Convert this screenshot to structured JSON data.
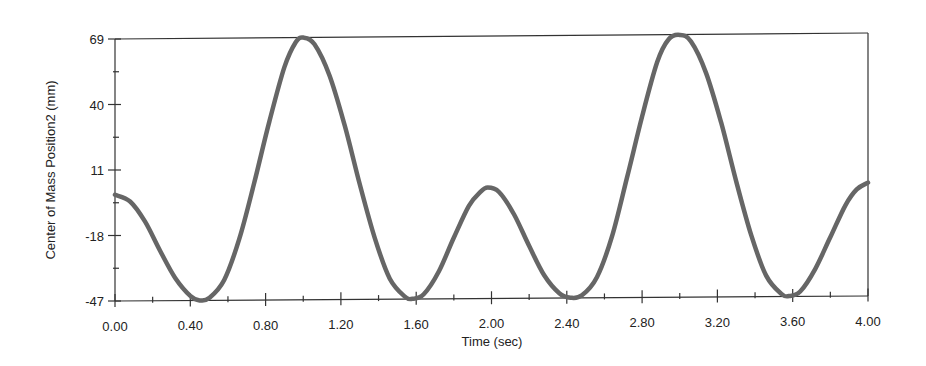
{
  "chart_data": {
    "type": "line",
    "title": "",
    "xlabel": "Time (sec)",
    "ylabel": "Center of Mass Position2 (mm)",
    "xlim": [
      0.0,
      4.0
    ],
    "ylim": [
      -47,
      69
    ],
    "grid": false,
    "legend": null,
    "x_ticks": [
      "0.00",
      "0.40",
      "0.80",
      "1.20",
      "1.60",
      "2.00",
      "2.40",
      "2.80",
      "3.20",
      "3.60",
      "4.00"
    ],
    "y_ticks": [
      "69",
      "40",
      "11",
      "-18",
      "-47"
    ],
    "series": [
      {
        "name": "Center of Mass Position2",
        "color": "#666666",
        "x": [
          0.0,
          0.08,
          0.16,
          0.24,
          0.32,
          0.4,
          0.45,
          0.5,
          0.58,
          0.66,
          0.74,
          0.82,
          0.9,
          0.96,
          1.0,
          1.06,
          1.14,
          1.22,
          1.3,
          1.38,
          1.46,
          1.54,
          1.58,
          1.64,
          1.72,
          1.8,
          1.88,
          1.94,
          1.98,
          2.04,
          2.12,
          2.2,
          2.28,
          2.36,
          2.42,
          2.48,
          2.56,
          2.64,
          2.72,
          2.8,
          2.88,
          2.94,
          3.0,
          3.06,
          3.14,
          3.22,
          3.3,
          3.38,
          3.46,
          3.54,
          3.58,
          3.64,
          3.72,
          3.8,
          3.88,
          3.94,
          4.0
        ],
        "values": [
          0,
          -3,
          -12,
          -25,
          -37,
          -45,
          -47,
          -46,
          -38,
          -20,
          5,
          32,
          56,
          67,
          69,
          66,
          52,
          30,
          4,
          -20,
          -38,
          -46,
          -47,
          -45,
          -35,
          -20,
          -6,
          0,
          2,
          0,
          -10,
          -24,
          -37,
          -45,
          -47,
          -46,
          -38,
          -20,
          6,
          33,
          57,
          67,
          69,
          66,
          52,
          30,
          4,
          -20,
          -38,
          -46,
          -47,
          -45,
          -35,
          -21,
          -7,
          0,
          3
        ]
      }
    ]
  },
  "colors": {
    "axis": "#333333",
    "line": "#666666",
    "background": "#ffffff"
  }
}
